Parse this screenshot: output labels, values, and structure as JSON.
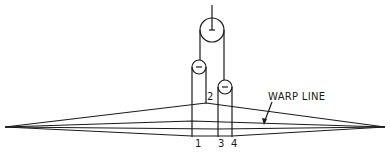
{
  "diagram": {
    "type": "heald shedding mechanism with pulleys",
    "labels": {
      "warp_line": "WARP LINE",
      "p1": "1",
      "p2": "2",
      "p3": "3",
      "p4": "4"
    },
    "colors": {
      "line": "#1a1a1a",
      "background": "#ffffff"
    }
  }
}
